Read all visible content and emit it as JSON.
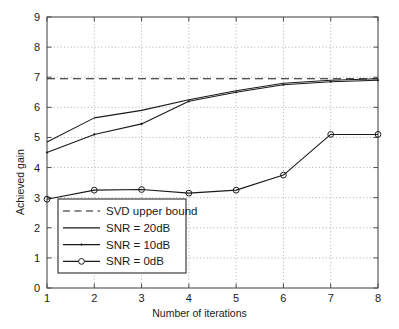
{
  "chart_data": {
    "type": "line",
    "title": "",
    "xlabel": "Number of iterations",
    "ylabel": "Achieved gain",
    "xlim": [
      1,
      8
    ],
    "ylim": [
      0,
      9
    ],
    "xticks": [
      "1",
      "2",
      "3",
      "4",
      "5",
      "6",
      "7",
      "8"
    ],
    "yticks": [
      "0",
      "1",
      "2",
      "3",
      "4",
      "5",
      "6",
      "7",
      "8",
      "9"
    ],
    "grid": true,
    "legend_position": "lower left",
    "x": [
      1,
      2,
      3,
      4,
      5,
      6,
      7,
      8
    ],
    "reference_line": {
      "name": "SVD upper bound",
      "value": 6.95,
      "style": "dashed"
    },
    "series": [
      {
        "name": "SNR = 20dB",
        "style": "solid",
        "marker": "none",
        "values": [
          4.85,
          5.65,
          5.9,
          6.25,
          6.55,
          6.8,
          6.9,
          6.95
        ]
      },
      {
        "name": "SNR = 10dB",
        "style": "solid",
        "marker": "dot",
        "values": [
          4.5,
          5.1,
          5.45,
          6.2,
          6.5,
          6.75,
          6.85,
          6.9
        ]
      },
      {
        "name": "SNR = 0dB",
        "style": "solid",
        "marker": "circle",
        "values": [
          2.95,
          3.25,
          3.27,
          3.15,
          3.25,
          3.75,
          5.1,
          5.1
        ]
      }
    ],
    "legend_entries": [
      "SVD upper bound",
      "SNR = 20dB",
      "SNR = 10dB",
      "SNR = 0dB"
    ],
    "colors": {
      "line": "#1a1a1a",
      "grid": "#9a9a9a",
      "axis": "#4d4d4d",
      "background": "#ffffff"
    }
  }
}
